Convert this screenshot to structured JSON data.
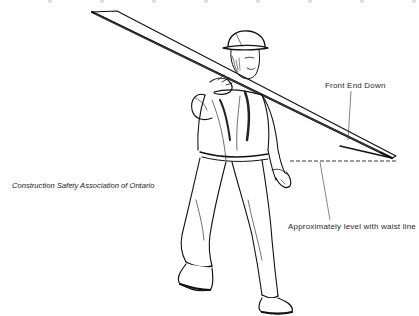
{
  "figure": {
    "colors": {
      "ink": "#111111",
      "label_text": "#2a2a2a",
      "background": "#ffffff"
    }
  },
  "annotations": {
    "front_end": "Front End Down",
    "waist_line": "Approximately level with waist line"
  },
  "credit": {
    "text": "Construction Safety Association of Ontario"
  }
}
